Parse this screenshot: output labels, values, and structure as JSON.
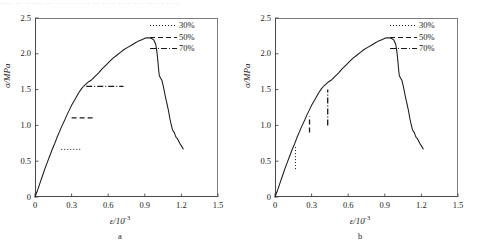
{
  "top_strip": {
    "text": "····  ··  ·····  ···  ····  ·····  ··  ····  ····  ···  ·····  ····"
  },
  "chart_data": [
    {
      "type": "line",
      "panel_id": "a",
      "caption": "a",
      "title": "",
      "xlabel": "ε/10",
      "xlabel_exp": "-3",
      "ylabel": "σ/MPa",
      "xlim": [
        0,
        1.5
      ],
      "ylim": [
        0,
        2.5
      ],
      "xticks": [
        "0",
        "0.3",
        "0.6",
        "0.9",
        "1.2",
        "1.5"
      ],
      "xtick_values": [
        0,
        0.3,
        0.6,
        0.9,
        1.2,
        1.5
      ],
      "yticks": [
        "0",
        "0.5",
        "1.0",
        "1.5",
        "2.0",
        "2.5"
      ],
      "ytick_values": [
        0,
        0.5,
        1.0,
        1.5,
        2.0,
        2.5
      ],
      "grid": false,
      "legend_position": "top-right",
      "legend": [
        {
          "label": "30%",
          "style": "dotted"
        },
        {
          "label": "50%",
          "style": "dashed"
        },
        {
          "label": "70%",
          "style": "dashdot"
        }
      ],
      "series": [
        {
          "name": "stress-strain curve",
          "style": "solid",
          "points": [
            [
              0.0,
              0.0
            ],
            [
              0.02,
              0.09
            ],
            [
              0.04,
              0.19
            ],
            [
              0.06,
              0.29
            ],
            [
              0.08,
              0.39
            ],
            [
              0.1,
              0.48
            ],
            [
              0.12,
              0.57
            ],
            [
              0.14,
              0.66
            ],
            [
              0.16,
              0.74
            ],
            [
              0.18,
              0.83
            ],
            [
              0.2,
              0.91
            ],
            [
              0.22,
              0.99
            ],
            [
              0.24,
              1.06
            ],
            [
              0.26,
              1.14
            ],
            [
              0.28,
              1.21
            ],
            [
              0.3,
              1.28
            ],
            [
              0.32,
              1.34
            ],
            [
              0.34,
              1.4
            ],
            [
              0.36,
              1.46
            ],
            [
              0.38,
              1.51
            ],
            [
              0.4,
              1.55
            ],
            [
              0.42,
              1.58
            ],
            [
              0.44,
              1.61
            ],
            [
              0.46,
              1.63
            ],
            [
              0.49,
              1.68
            ],
            [
              0.52,
              1.73
            ],
            [
              0.55,
              1.79
            ],
            [
              0.58,
              1.84
            ],
            [
              0.61,
              1.89
            ],
            [
              0.64,
              1.94
            ],
            [
              0.67,
              1.98
            ],
            [
              0.7,
              2.02
            ],
            [
              0.73,
              2.06
            ],
            [
              0.76,
              2.09
            ],
            [
              0.79,
              2.12
            ],
            [
              0.82,
              2.15
            ],
            [
              0.85,
              2.18
            ],
            [
              0.88,
              2.2
            ],
            [
              0.905,
              2.22
            ],
            [
              0.925,
              2.225
            ],
            [
              0.945,
              2.22
            ],
            [
              0.96,
              2.21
            ],
            [
              0.975,
              2.19
            ],
            [
              0.99,
              2.13
            ],
            [
              1.0,
              2.02
            ],
            [
              1.008,
              1.88
            ],
            [
              1.015,
              1.75
            ],
            [
              1.02,
              1.69
            ],
            [
              1.03,
              1.66
            ],
            [
              1.04,
              1.63
            ],
            [
              1.05,
              1.56
            ],
            [
              1.06,
              1.48
            ],
            [
              1.07,
              1.39
            ],
            [
              1.082,
              1.3
            ],
            [
              1.095,
              1.2
            ],
            [
              1.105,
              1.1
            ],
            [
              1.115,
              1.02
            ],
            [
              1.125,
              0.95
            ],
            [
              1.133,
              0.92
            ],
            [
              1.142,
              0.9
            ],
            [
              1.15,
              0.86
            ],
            [
              1.158,
              0.83
            ],
            [
              1.165,
              0.82
            ],
            [
              1.175,
              0.79
            ],
            [
              1.19,
              0.74
            ],
            [
              1.205,
              0.7
            ],
            [
              1.215,
              0.67
            ]
          ]
        }
      ],
      "markers": [
        {
          "label": "30%",
          "style": "dotted",
          "orientation": "horizontal",
          "y": 0.665,
          "x_start": 0.215,
          "x_end": 0.385
        },
        {
          "label": "50%",
          "style": "dashed",
          "orientation": "horizontal",
          "y": 1.105,
          "x_start": 0.3,
          "x_end": 0.48
        },
        {
          "label": "70%",
          "style": "dashdot",
          "orientation": "horizontal",
          "y": 1.545,
          "x_start": 0.42,
          "x_end": 0.725
        }
      ]
    },
    {
      "type": "line",
      "panel_id": "b",
      "caption": "b",
      "title": "",
      "xlabel": "ε/10",
      "xlabel_exp": "-3",
      "ylabel": "σ/MPa",
      "xlim": [
        0,
        1.5
      ],
      "ylim": [
        0,
        2.5
      ],
      "xticks": [
        "0",
        "0.3",
        "0.6",
        "0.9",
        "1.2",
        "1.5"
      ],
      "xtick_values": [
        0,
        0.3,
        0.6,
        0.9,
        1.2,
        1.5
      ],
      "yticks": [
        "0",
        "0.5",
        "1.0",
        "1.5",
        "2.0",
        "2.5"
      ],
      "ytick_values": [
        0,
        0.5,
        1.0,
        1.5,
        2.0,
        2.5
      ],
      "grid": false,
      "legend_position": "top-right",
      "legend": [
        {
          "label": "30%",
          "style": "dotted"
        },
        {
          "label": "50%",
          "style": "dashed"
        },
        {
          "label": "70%",
          "style": "dashdot"
        }
      ],
      "series": [
        {
          "name": "stress-strain curve",
          "style": "solid",
          "points": [
            [
              0.0,
              0.0
            ],
            [
              0.02,
              0.09
            ],
            [
              0.04,
              0.19
            ],
            [
              0.06,
              0.29
            ],
            [
              0.08,
              0.39
            ],
            [
              0.1,
              0.48
            ],
            [
              0.12,
              0.57
            ],
            [
              0.14,
              0.66
            ],
            [
              0.16,
              0.74
            ],
            [
              0.18,
              0.83
            ],
            [
              0.2,
              0.91
            ],
            [
              0.22,
              0.99
            ],
            [
              0.24,
              1.06
            ],
            [
              0.26,
              1.14
            ],
            [
              0.28,
              1.21
            ],
            [
              0.3,
              1.28
            ],
            [
              0.32,
              1.34
            ],
            [
              0.34,
              1.4
            ],
            [
              0.36,
              1.46
            ],
            [
              0.38,
              1.51
            ],
            [
              0.4,
              1.55
            ],
            [
              0.42,
              1.58
            ],
            [
              0.44,
              1.61
            ],
            [
              0.46,
              1.63
            ],
            [
              0.49,
              1.68
            ],
            [
              0.52,
              1.73
            ],
            [
              0.55,
              1.79
            ],
            [
              0.58,
              1.84
            ],
            [
              0.61,
              1.89
            ],
            [
              0.64,
              1.94
            ],
            [
              0.67,
              1.98
            ],
            [
              0.7,
              2.02
            ],
            [
              0.73,
              2.06
            ],
            [
              0.76,
              2.09
            ],
            [
              0.79,
              2.12
            ],
            [
              0.82,
              2.15
            ],
            [
              0.85,
              2.18
            ],
            [
              0.88,
              2.2
            ],
            [
              0.905,
              2.22
            ],
            [
              0.925,
              2.225
            ],
            [
              0.945,
              2.22
            ],
            [
              0.96,
              2.21
            ],
            [
              0.975,
              2.19
            ],
            [
              0.99,
              2.13
            ],
            [
              1.0,
              2.02
            ],
            [
              1.008,
              1.88
            ],
            [
              1.015,
              1.75
            ],
            [
              1.02,
              1.69
            ],
            [
              1.03,
              1.66
            ],
            [
              1.04,
              1.63
            ],
            [
              1.05,
              1.56
            ],
            [
              1.06,
              1.48
            ],
            [
              1.07,
              1.39
            ],
            [
              1.082,
              1.3
            ],
            [
              1.095,
              1.2
            ],
            [
              1.105,
              1.1
            ],
            [
              1.115,
              1.02
            ],
            [
              1.125,
              0.95
            ],
            [
              1.133,
              0.92
            ],
            [
              1.142,
              0.9
            ],
            [
              1.15,
              0.86
            ],
            [
              1.158,
              0.83
            ],
            [
              1.165,
              0.82
            ],
            [
              1.175,
              0.79
            ],
            [
              1.19,
              0.74
            ],
            [
              1.205,
              0.7
            ],
            [
              1.215,
              0.67
            ]
          ]
        }
      ],
      "markers": [
        {
          "label": "30%",
          "style": "dotted",
          "orientation": "vertical",
          "x": 0.168,
          "y_start": 0.39,
          "y_end": 0.72
        },
        {
          "label": "50%",
          "style": "dashed",
          "orientation": "vertical",
          "x": 0.283,
          "y_start": 0.9,
          "y_end": 1.13
        },
        {
          "label": "70%",
          "style": "dashdot",
          "orientation": "vertical",
          "x": 0.432,
          "y_start": 1.0,
          "y_end": 1.5
        }
      ]
    }
  ]
}
